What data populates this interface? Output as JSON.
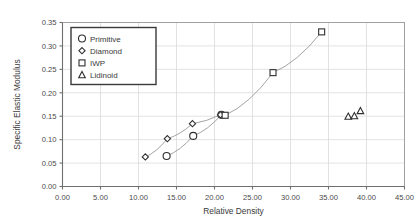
{
  "chart_data": {
    "type": "scatter",
    "title": "",
    "xlabel": "Relative Density",
    "ylabel": "Specific Elastic Modulus",
    "xlim": [
      0,
      45
    ],
    "ylim": [
      0.0,
      0.35
    ],
    "grid": true,
    "legend_position": "top-left",
    "xticks": [
      "0.00",
      "5.00",
      "10.00",
      "15.00",
      "20.00",
      "25.00",
      "30.00",
      "35.00",
      "40.00",
      "45.00"
    ],
    "xtick_values": [
      0,
      5,
      10,
      15,
      20,
      25,
      30,
      35,
      40,
      45
    ],
    "yticks": [
      "0.00",
      "0.05",
      "0.10",
      "0.15",
      "0.20",
      "0.25",
      "0.30",
      "0.35"
    ],
    "ytick_values": [
      0.0,
      0.05,
      0.1,
      0.15,
      0.2,
      0.25,
      0.3,
      0.35
    ],
    "series": [
      {
        "name": "Primitive",
        "marker": "circle",
        "trendline": true,
        "points": [
          {
            "x": 13.7,
            "y": 0.065
          },
          {
            "x": 17.2,
            "y": 0.108
          },
          {
            "x": 20.9,
            "y": 0.153
          }
        ]
      },
      {
        "name": "Diamond",
        "marker": "diamond",
        "trendline": true,
        "points": [
          {
            "x": 10.9,
            "y": 0.063
          },
          {
            "x": 13.8,
            "y": 0.102
          },
          {
            "x": 17.1,
            "y": 0.134
          },
          {
            "x": 20.8,
            "y": 0.153
          }
        ]
      },
      {
        "name": "IWP",
        "marker": "square",
        "trendline": true,
        "points": [
          {
            "x": 21.4,
            "y": 0.152
          },
          {
            "x": 27.7,
            "y": 0.243
          },
          {
            "x": 34.1,
            "y": 0.33
          }
        ]
      },
      {
        "name": "Lidinoid",
        "marker": "triangle",
        "trendline": false,
        "points": [
          {
            "x": 37.6,
            "y": 0.149
          },
          {
            "x": 38.4,
            "y": 0.15
          },
          {
            "x": 39.2,
            "y": 0.161
          }
        ]
      }
    ]
  },
  "legend": {
    "items": [
      {
        "label": "Primitive",
        "marker": "circle"
      },
      {
        "label": "Diamond",
        "marker": "diamond"
      },
      {
        "label": "IWP",
        "marker": "square"
      },
      {
        "label": "Lidinoid",
        "marker": "triangle"
      }
    ]
  },
  "colors": {
    "marker_stroke": "#2f2f2f",
    "grid": "#d5d5d5",
    "axis": "#6f6f6f",
    "text": "#3a3a3a",
    "background": "#ffffff"
  }
}
